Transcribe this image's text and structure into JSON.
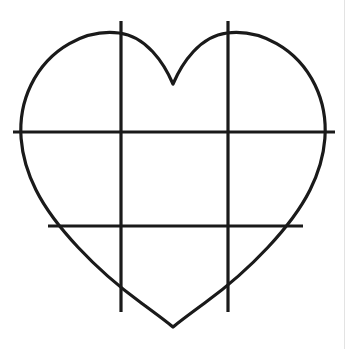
{
  "document": {
    "title": "Heart outline with grid guide lines",
    "background_color": "#ffffff",
    "width": 356,
    "height": 349
  },
  "palette": {
    "stroke": "#1a1a1a",
    "background": "#ffffff",
    "page_edge": "#e3e3e3"
  },
  "figure": {
    "name": "heart-with-grid",
    "caption": "Heart outline crossed by two vertical and two horizontal guide lines",
    "stroke_width": 3.2,
    "heart": {
      "name": "heart-outline",
      "left_x": 23,
      "right_x": 323,
      "top_lobe_y": 34,
      "notch_point": [
        173,
        84
      ],
      "bottom_point": [
        173,
        327
      ],
      "widest_y": 132,
      "path": "M 173 84 C 164 63 146 36 119 33 C 86 29 49 48 31 85 C 14 120 20 158 36 190 C 54 226 96 270 140 302 C 155 313 166 321 173 327 C 180 321 191 313 206 302 C 250 270 292 226 310 190 C 326 158 332 120 315 85 C 297 48 260 29 227 33 C 200 36 182 63 173 84 Z"
    },
    "grid_lines": [
      {
        "name": "vertical-guide-left",
        "orientation": "vertical",
        "x": 121,
        "y1": 21,
        "y2": 312
      },
      {
        "name": "vertical-guide-right",
        "orientation": "vertical",
        "x": 228,
        "y1": 21,
        "y2": 312
      },
      {
        "name": "horizontal-guide-upper",
        "orientation": "horizontal",
        "y": 132,
        "x1": 13,
        "x2": 335
      },
      {
        "name": "horizontal-guide-lower",
        "orientation": "horizontal",
        "y": 226,
        "x1": 48,
        "x2": 303
      }
    ]
  }
}
